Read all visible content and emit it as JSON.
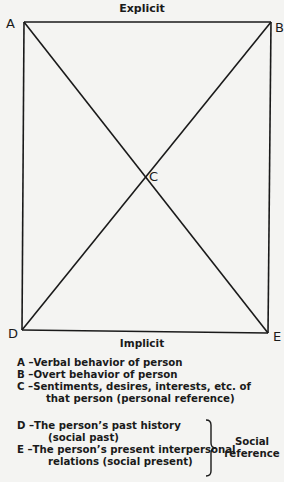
{
  "diagram": {
    "top_label": "Explicit",
    "bottom_label": "Implicit",
    "corners": {
      "A": "A",
      "B": "B",
      "C": "C",
      "D": "D",
      "E": "E"
    },
    "line_color": "#1a1a1a"
  },
  "legend": {
    "items": [
      {
        "key": "A",
        "dash": "–",
        "text": "Verbal behavior of person"
      },
      {
        "key": "B",
        "dash": "–",
        "text": "Overt behavior of person"
      },
      {
        "key": "C",
        "dash": "–",
        "text": "Sentiments, desires, interests, etc. of",
        "cont": "that person (personal reference)"
      }
    ],
    "social_items": [
      {
        "key": "D",
        "dash": "–",
        "text": "The person’s past history",
        "cont": "(social past)"
      },
      {
        "key": "E",
        "dash": "–",
        "text": "The person’s present interpersonal",
        "cont": "relations (social present)"
      }
    ],
    "group_label_line1": "Social",
    "group_label_line2": "reference"
  }
}
